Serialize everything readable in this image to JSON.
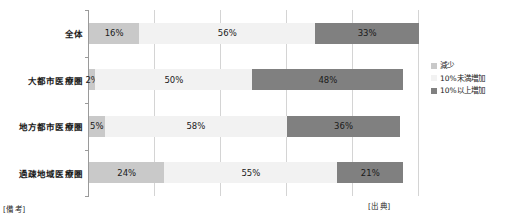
{
  "chart_data": {
    "type": "bar",
    "orientation": "horizontal",
    "stacked": true,
    "title": "",
    "xlabel": "",
    "ylabel": "",
    "xlim": [
      0,
      105
    ],
    "grid": true,
    "gridlines_at": [
      0,
      21,
      42,
      63,
      84,
      105
    ],
    "legend_position": "right",
    "categories": [
      "全体",
      "大都市医療圏",
      "地方都市医療圏",
      "過疎地域医療圏"
    ],
    "series": [
      {
        "name": "減少",
        "color": "#c9c9c9",
        "values": [
          16,
          2,
          5,
          24
        ],
        "labels": [
          "16%",
          "2%",
          "5%",
          "24%"
        ]
      },
      {
        "name": "10%未満増加",
        "color": "#f2f2f2",
        "values": [
          56,
          50,
          58,
          55
        ],
        "labels": [
          "56%",
          "50%",
          "58%",
          "55%"
        ]
      },
      {
        "name": "10%以上増加",
        "color": "#808080",
        "values": [
          33,
          48,
          36,
          21
        ],
        "labels": [
          "33%",
          "48%",
          "36%",
          "21%"
        ]
      }
    ]
  },
  "legend": {
    "items": [
      {
        "label": "減少",
        "color": "#c9c9c9"
      },
      {
        "label": "10%未満増加",
        "color": "#f2f2f2"
      },
      {
        "label": "10%以上増加",
        "color": "#808080"
      }
    ]
  },
  "footer": {
    "left": "[備 考]",
    "right": "[出 典]"
  }
}
